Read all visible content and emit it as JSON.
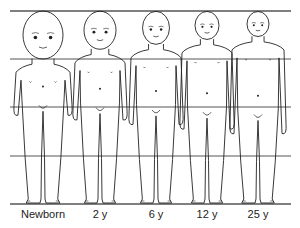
{
  "figure": {
    "guide_lines_y": [
      11,
      59,
      107,
      156,
      204
    ],
    "line_color": "#555555",
    "stroke_color": "#222222",
    "figures": [
      {
        "label": "Newborn",
        "cx": 43,
        "head_h": 48,
        "head_w": 40,
        "shoulder_w": 54,
        "total_h": 193
      },
      {
        "label": "2 y",
        "cx": 100,
        "head_h": 38,
        "head_w": 32,
        "shoulder_w": 50,
        "total_h": 193
      },
      {
        "label": "6 y",
        "cx": 156,
        "head_h": 33,
        "head_w": 27,
        "shoulder_w": 50,
        "total_h": 193
      },
      {
        "label": "12 y",
        "cx": 207,
        "head_h": 28,
        "head_w": 24,
        "shoulder_w": 50,
        "total_h": 193
      },
      {
        "label": "25 y",
        "cx": 258,
        "head_h": 25,
        "head_w": 22,
        "shoulder_w": 52,
        "total_h": 193
      }
    ]
  },
  "labels": [
    "Newborn",
    "2 y",
    "6 y",
    "12 y",
    "25 y"
  ]
}
